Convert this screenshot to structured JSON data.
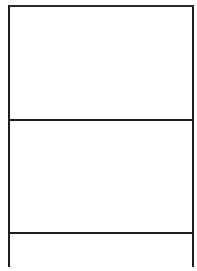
{
  "diagram": {
    "type": "stacked-empty-panels",
    "stroke_color": "#1e1e1e",
    "background_color": "#ffffff",
    "frame": {
      "left": 8,
      "top": 5,
      "right": 194
    },
    "panels": [
      {
        "id": "panel-1",
        "label": "",
        "top": 5,
        "bottom": 119
      },
      {
        "id": "panel-2",
        "label": "",
        "top": 119,
        "bottom": 232
      },
      {
        "id": "panel-3",
        "label": "",
        "top": 232,
        "bottom": 260
      }
    ],
    "dividers_y": [
      119,
      232
    ]
  }
}
